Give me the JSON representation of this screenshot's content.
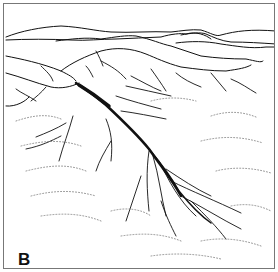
{
  "figure": {
    "panel_label": "B",
    "colors": {
      "ink": "#111111",
      "frame": "#777777",
      "background": "#ffffff"
    }
  }
}
